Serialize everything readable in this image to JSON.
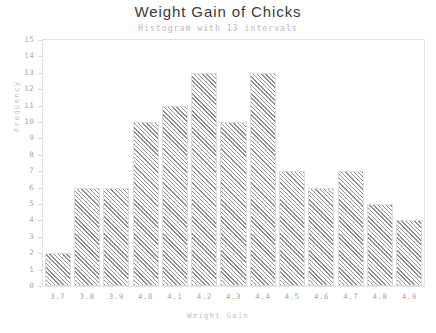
{
  "chart_data": {
    "type": "bar",
    "title": "Weight Gain of Chicks",
    "subtitle": "Histogram with 13 intervals",
    "xlabel": "Weight Gain",
    "ylabel": "Frequency",
    "categories": [
      "3.7",
      "3.8",
      "3.9",
      "4.0",
      "4.1",
      "4.2",
      "4.3",
      "4.4",
      "4.5",
      "4.6",
      "4.7",
      "4.8",
      "4.9"
    ],
    "values": [
      2,
      6,
      6,
      10,
      11,
      13,
      10,
      13,
      7,
      6,
      7,
      5,
      4
    ],
    "ylim": [
      0,
      15
    ],
    "yticks": [
      0,
      1,
      2,
      3,
      4,
      5,
      6,
      7,
      8,
      9,
      10,
      11,
      12,
      13,
      14,
      15
    ],
    "ytick_labels": [
      "0",
      "1",
      "2",
      "3",
      "4",
      "5",
      "6",
      "7",
      "8",
      "9",
      "10",
      "11",
      "12",
      "13",
      "14",
      "15"
    ],
    "grid": false,
    "legend": "none",
    "bar_fill": "diagonal-hatch",
    "colors": {
      "hatch": "#8e8e8e",
      "bar_border": "#dcdcdc",
      "frame": "#e2e2e2",
      "title_text": "#3a3a3a",
      "axis_text": "#a8a8a8",
      "axis_title_text": "#c2c2c2",
      "subtitle_text": "#b9b9b9",
      "background": "#ffffff"
    }
  }
}
